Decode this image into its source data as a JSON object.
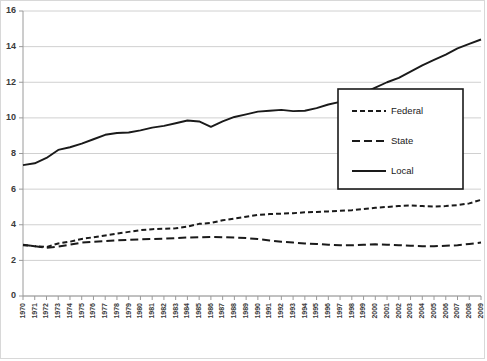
{
  "chart_data": {
    "type": "line",
    "title": "",
    "xlabel": "",
    "ylabel": "",
    "ylim": [
      0,
      16
    ],
    "ytick_step": 2,
    "yticks": [
      "0",
      "2",
      "4",
      "6",
      "8",
      "10",
      "12",
      "14",
      "16"
    ],
    "grid": true,
    "legend_position": "center-right",
    "x": [
      1970,
      1971,
      1972,
      1973,
      1974,
      1975,
      1976,
      1977,
      1978,
      1979,
      1980,
      1981,
      1982,
      1983,
      1984,
      1985,
      1986,
      1987,
      1988,
      1989,
      1990,
      1991,
      1992,
      1993,
      1994,
      1995,
      1996,
      1997,
      1998,
      1999,
      2000,
      2001,
      2002,
      2003,
      2004,
      2005,
      2006,
      2007,
      2008,
      2009
    ],
    "categories": [
      "1970",
      "1971",
      "1972",
      "1973",
      "1974",
      "1975",
      "1976",
      "1977",
      "1978",
      "1979",
      "1980",
      "1981",
      "1982",
      "1983",
      "1984",
      "1985",
      "1986",
      "1987",
      "1988",
      "1989",
      "1990",
      "1991",
      "1992",
      "1993",
      "1994",
      "1995",
      "1996",
      "1997",
      "1998",
      "1999",
      "2000",
      "2001",
      "2002",
      "2003",
      "2004",
      "2005",
      "2006",
      "2007",
      "2008",
      "2009"
    ],
    "series": [
      {
        "name": "Federal",
        "style": "dash-dot",
        "color": "#1a1a1a",
        "values": [
          2.85,
          2.8,
          2.75,
          2.95,
          3.05,
          3.2,
          3.3,
          3.4,
          3.5,
          3.6,
          3.7,
          3.75,
          3.78,
          3.8,
          3.9,
          4.05,
          4.1,
          4.25,
          4.35,
          4.45,
          4.55,
          4.6,
          4.62,
          4.65,
          4.7,
          4.72,
          4.75,
          4.78,
          4.82,
          4.88,
          4.95,
          5.0,
          5.05,
          5.08,
          5.05,
          5.02,
          5.05,
          5.1,
          5.2,
          5.4
        ]
      },
      {
        "name": "State",
        "style": "dashed",
        "color": "#1a1a1a",
        "values": [
          2.88,
          2.8,
          2.7,
          2.78,
          2.88,
          3.0,
          3.05,
          3.08,
          3.12,
          3.15,
          3.18,
          3.2,
          3.22,
          3.25,
          3.28,
          3.3,
          3.32,
          3.3,
          3.28,
          3.25,
          3.2,
          3.12,
          3.05,
          3.0,
          2.95,
          2.92,
          2.88,
          2.85,
          2.85,
          2.88,
          2.9,
          2.88,
          2.85,
          2.82,
          2.8,
          2.8,
          2.82,
          2.85,
          2.92,
          3.0
        ]
      },
      {
        "name": "Local",
        "style": "solid",
        "color": "#1a1a1a",
        "values": [
          7.35,
          7.45,
          7.75,
          8.2,
          8.35,
          8.55,
          8.8,
          9.05,
          9.15,
          9.18,
          9.3,
          9.45,
          9.55,
          9.7,
          9.85,
          9.8,
          9.5,
          9.8,
          10.05,
          10.2,
          10.35,
          10.4,
          10.45,
          10.38,
          10.4,
          10.55,
          10.75,
          10.9,
          11.15,
          11.4,
          11.7,
          12.0,
          12.25,
          12.6,
          12.95,
          13.25,
          13.55,
          13.9,
          14.15,
          14.4
        ]
      }
    ]
  },
  "legend": {
    "items": [
      {
        "label": "Federal"
      },
      {
        "label": "State"
      },
      {
        "label": "Local"
      }
    ]
  }
}
